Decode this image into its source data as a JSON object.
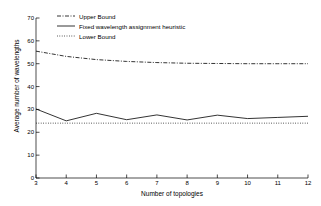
{
  "chart_data": {
    "type": "line",
    "title": "",
    "xlabel": "Number of topologies",
    "ylabel": "Average number of wavelengths",
    "xlim": [
      3,
      12
    ],
    "ylim": [
      0,
      70
    ],
    "xticks": [
      3,
      4,
      5,
      6,
      7,
      8,
      9,
      10,
      11,
      12
    ],
    "yticks": [
      0,
      10,
      20,
      30,
      40,
      50,
      60,
      70
    ],
    "grid": false,
    "legend_position": "top-left-inside",
    "x": [
      3,
      4,
      5,
      6,
      7,
      8,
      9,
      10,
      11,
      12
    ],
    "series": [
      {
        "name": "Upper Bound",
        "style": "dash-dot",
        "color": "#000000",
        "values": [
          55.5,
          53.2,
          51.8,
          51.0,
          50.5,
          50.2,
          50.1,
          50.0,
          50.0,
          50.0
        ]
      },
      {
        "name": "Fixed wavelength assignment heuristic",
        "style": "solid",
        "color": "#000000",
        "values": [
          30.2,
          25.0,
          28.3,
          25.5,
          27.6,
          25.4,
          27.5,
          26.0,
          26.5,
          27.0
        ]
      },
      {
        "name": "Lower Bound",
        "style": "dotted",
        "color": "#000000",
        "values": [
          24.0,
          24.0,
          24.0,
          24.0,
          24.0,
          24.0,
          24.0,
          24.0,
          24.0,
          24.0
        ]
      }
    ]
  },
  "legend": {
    "items": [
      {
        "label": "Upper Bound",
        "style": "dash-dot"
      },
      {
        "label": "Fixed wavelength assignment heuristic",
        "style": "solid"
      },
      {
        "label": "Lower Bound",
        "style": "dotted"
      }
    ]
  },
  "axes": {
    "x_label": "Number of topologies",
    "y_label": "Average number of wavelengths",
    "x_tick_labels": [
      "3",
      "4",
      "5",
      "6",
      "7",
      "8",
      "9",
      "10",
      "11",
      "12"
    ],
    "y_tick_labels": [
      "0",
      "10",
      "20",
      "30",
      "40",
      "50",
      "60",
      "70"
    ]
  },
  "colors": {
    "axis": "#000000",
    "line": "#000000",
    "background": "#ffffff"
  }
}
